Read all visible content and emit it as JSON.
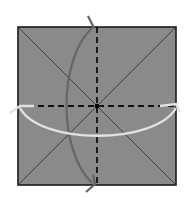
{
  "diagram": {
    "type": "origami-fold-diagram",
    "paper": {
      "x": 18,
      "y": 27,
      "size": 158,
      "fill": "#8a8a8a",
      "stroke": "#1a1a1a"
    },
    "center": {
      "x": 97,
      "y": 106
    },
    "creases": {
      "diagonals": "mountain (solid thin)",
      "midlines": "valley (dashed)"
    },
    "arrows": [
      {
        "name": "vertical-fold-arrow",
        "color": "#6e6e6e",
        "direction": "top-to-bottom"
      },
      {
        "name": "horizontal-fold-arrow",
        "color": "#e6e6e6",
        "direction": "left-and-right"
      }
    ]
  }
}
